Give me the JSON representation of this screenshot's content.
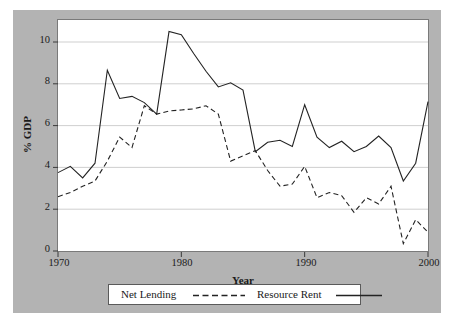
{
  "chart_data": {
    "type": "line",
    "title": "",
    "xlabel": "Year",
    "ylabel": "% GDP",
    "xlim": [
      1970,
      2000
    ],
    "ylim": [
      0,
      11
    ],
    "grid": true,
    "grid_axis": "y",
    "legend_position": "bottom-outside",
    "xticks": [
      "1970",
      "1980",
      "1990",
      "2000"
    ],
    "yticks": [
      "0",
      "2",
      "4",
      "6",
      "8",
      "10"
    ],
    "x": [
      1970,
      1971,
      1972,
      1973,
      1974,
      1975,
      1976,
      1977,
      1978,
      1979,
      1980,
      1981,
      1982,
      1983,
      1984,
      1985,
      1986,
      1987,
      1988,
      1989,
      1990,
      1991,
      1992,
      1993,
      1994,
      1995,
      1996,
      1997,
      1998,
      1999,
      2000
    ],
    "series": [
      {
        "name": "Net Lending",
        "style": "dashed",
        "color": "#232323",
        "values": [
          2.6,
          2.8,
          3.1,
          3.35,
          4.3,
          5.45,
          4.95,
          6.95,
          6.55,
          6.7,
          6.75,
          6.8,
          6.95,
          6.55,
          4.3,
          4.55,
          4.8,
          3.85,
          3.1,
          3.2,
          4.05,
          2.55,
          2.8,
          2.65,
          1.85,
          2.55,
          2.25,
          3.1,
          0.35,
          1.5,
          0.9
        ]
      },
      {
        "name": "Resource Rent",
        "style": "solid",
        "color": "#232323",
        "values": [
          3.75,
          4.05,
          3.5,
          4.2,
          8.65,
          7.3,
          7.4,
          7.1,
          6.55,
          10.5,
          10.35,
          9.45,
          8.6,
          7.85,
          8.05,
          7.7,
          4.75,
          5.2,
          5.3,
          5.0,
          7.0,
          5.45,
          4.95,
          5.25,
          4.75,
          5.0,
          5.5,
          4.95,
          3.35,
          4.2,
          7.15
        ]
      }
    ]
  },
  "axes": {
    "ylabel_text": "% GDP",
    "xlabel_text": "Year",
    "ytick_labels": [
      "10",
      "8",
      "6",
      "4",
      "2",
      "0"
    ],
    "xtick_labels": [
      "1970",
      "1980",
      "1990",
      "2000"
    ]
  },
  "legend": {
    "entries": [
      {
        "label": "Net Lending",
        "key": "dashed-line-key"
      },
      {
        "label": "Resource Rent",
        "key": "solid-line-key"
      }
    ]
  }
}
